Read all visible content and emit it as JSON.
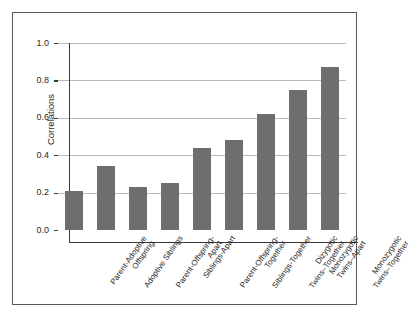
{
  "chart_data": {
    "type": "bar",
    "title": "",
    "subtitle": "",
    "xlabel": "",
    "ylabel": "Correlations",
    "ylim": [
      0.0,
      1.05
    ],
    "yticks": [
      "0.0",
      "0.2",
      "0.4",
      "0.6",
      "0.8",
      "1.0"
    ],
    "ytick_values": [
      0.0,
      0.2,
      0.4,
      0.6,
      0.8,
      1.0
    ],
    "grid": "horizontal",
    "legend": "none",
    "bar_color": "#6e6e6e",
    "categories": [
      "Parent-Adoptive Offspring",
      "Adoptive Siblings",
      "Parent-Offspring-Apart",
      "Siblings-Apart",
      "Parent-Offspring-Together",
      "Siblings-Together",
      "Dizygotic Twins–Together",
      "Monozygotic Twins–Apart",
      "Monozygotic Twins–Together"
    ],
    "category_lines": [
      [
        "Parent-Adoptive",
        "Offspring"
      ],
      [
        "Adoptive Siblings",
        ""
      ],
      [
        "Parent-Offspring-",
        "Apart"
      ],
      [
        "Siblings-Apart",
        ""
      ],
      [
        "Parent-Offspring-",
        "Together"
      ],
      [
        "Siblings-Together",
        ""
      ],
      [
        "Dizygotic",
        "Twins–Together"
      ],
      [
        "Monozygotic",
        "Twins–Apart"
      ],
      [
        "Monozygotic",
        "Twins–Together"
      ]
    ],
    "values": [
      0.21,
      0.34,
      0.23,
      0.25,
      0.44,
      0.48,
      0.62,
      0.75,
      0.87
    ]
  }
}
